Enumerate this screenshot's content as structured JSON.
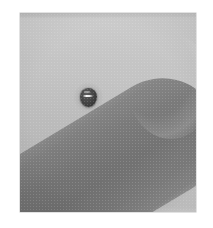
{
  "page": {
    "width": 213,
    "height": 228,
    "background_color": "#ffffff",
    "media_type": "halftone-printed grayscale photograph"
  },
  "plate": {
    "left": 20,
    "top": 13,
    "width": 176,
    "height": 199,
    "background_color": "#bfbfbf",
    "border_color": "#969696"
  },
  "scene": {
    "description": "Grayscale close-up photograph of an elongated rounded object lying diagonally across a plain light background, with a small dark specimen resting on its upper surface.",
    "subject": {
      "name": "elongated-rounded-object",
      "fill_color": "#6b6b6b",
      "highlight_color": "#8b8b8b",
      "rotation_degrees": -31,
      "tip_position": "upper-right",
      "entry_edge": "left"
    },
    "specimen": {
      "name": "dark-specimen",
      "fill_color": "#242424",
      "glint_color": "#ffffff",
      "center_x": 88,
      "center_y": 97,
      "width": 17,
      "height": 19
    },
    "background": {
      "name": "plain-backdrop",
      "light_color": "#c9c9c9",
      "mid_color": "#bababa"
    }
  },
  "texture": {
    "halftone": "dither-screen",
    "grain": "photocopy-grain",
    "vignette": "subtle"
  }
}
